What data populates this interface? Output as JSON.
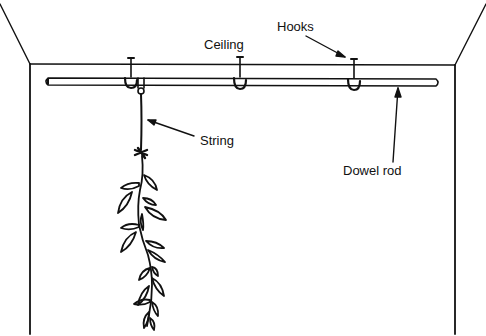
{
  "diagram": {
    "labels": {
      "ceiling": "Ceiling",
      "hooks": "Hooks",
      "string": "String",
      "dowel_rod": "Dowel rod"
    },
    "colors": {
      "ink": "#111111",
      "background": "#ffffff"
    },
    "hook_count": 3
  }
}
